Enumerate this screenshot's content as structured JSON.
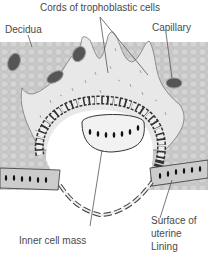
{
  "diagram": {
    "type": "anatomical-illustration",
    "labels": {
      "cords": "Cords of trophoblastic cells",
      "decidua": "Decidua",
      "capillary": "Capillary",
      "inner_cell_mass": "Inner cell mass",
      "surface_line1": "Surface of",
      "surface_line2": "uterine",
      "surface_line3": "Lining"
    },
    "colors": {
      "decidua_fill": "#c9c9c9",
      "trophoblast_fill": "#e6e6e6",
      "capillary_fill": "#555555",
      "nucleus": "#1a1a1a",
      "outline": "#6e6e6e",
      "background": "#ffffff"
    }
  }
}
